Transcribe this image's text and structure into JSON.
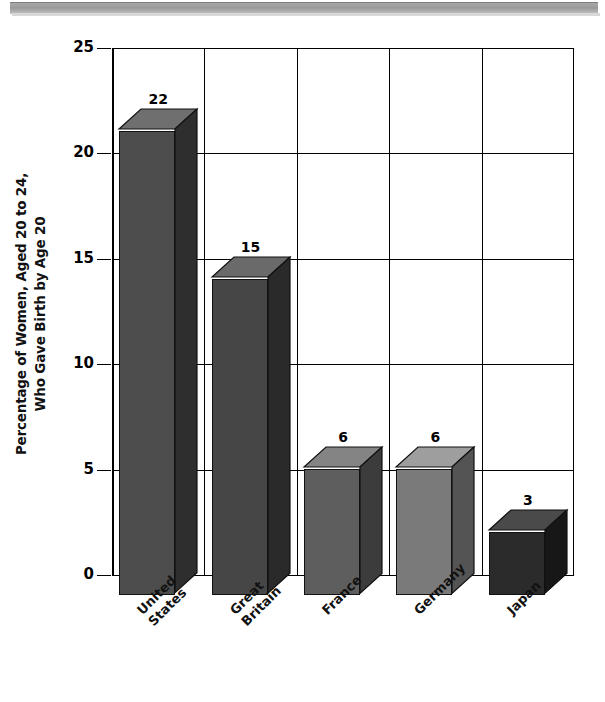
{
  "page": {
    "decoration": "gray-band"
  },
  "chart_data": {
    "type": "bar",
    "title": "",
    "subtitle": "",
    "xlabel": "",
    "ylabel": "Percentage of Women, Aged 20 to 24, Who Gave Birth by Age 20",
    "ylabel_lines": [
      "Percentage of Women, Aged 20 to 24,",
      "Who Gave Birth by Age 20"
    ],
    "categories": [
      "United States",
      "Great Britain",
      "France",
      "Germany",
      "Japan"
    ],
    "category_lines": [
      "United\nStates",
      "Great\nBritain",
      "France",
      "Germany",
      "Japan"
    ],
    "values": [
      22,
      15,
      6,
      6,
      3
    ],
    "value_labels": [
      "22",
      "15",
      "6",
      "6",
      "3"
    ],
    "ylim": [
      0,
      25
    ],
    "yticks": [
      0,
      5,
      10,
      15,
      20,
      25
    ],
    "ytick_labels": [
      "0",
      "5",
      "10",
      "15",
      "20",
      "25"
    ],
    "grid": "horizontal-and-vertical",
    "legend": "none",
    "bar_colors": [
      "#4d4d4d",
      "#464646",
      "#5e5e5e",
      "#7a7a7a",
      "#2b2b2b"
    ],
    "bar_top_colors": [
      "#6f6f6f",
      "#6a6a6a",
      "#848484",
      "#9e9e9e",
      "#4a4a4a"
    ],
    "bar_side_colors": [
      "#2e2e2e",
      "#2a2a2a",
      "#3c3c3c",
      "#545454",
      "#171717"
    ],
    "style": "3d-bars-grayscale"
  }
}
